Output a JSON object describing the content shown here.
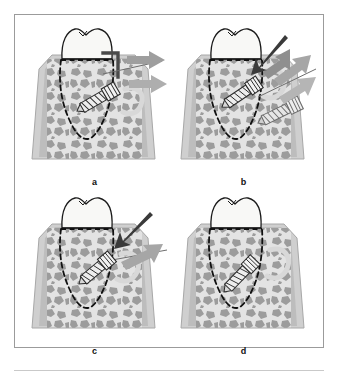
{
  "figure": {
    "kind": "dental-surgical-illustration",
    "frame_border_color": "#9b9b9b",
    "background_color": "#ffffff",
    "panel_count": 4
  },
  "palette": {
    "enamel_fill": "#f7f7f5",
    "enamel_outline": "#1a1a1a",
    "cortical_bone": "#b8b8b8",
    "cortical_bone_edge": "#d7d7d7",
    "trabecular_bg": "#e2e2e2",
    "trabecular_fill": "#9a9a9a",
    "root_outline_dashed": "#111111",
    "arrow_gray": "#9e9e9e",
    "arrow_gray_light": "#b5b5b5",
    "arrow_dark": "#3a3a3a",
    "screw_outline": "#2a2a2a",
    "screw_fill": "#ededed",
    "instrument_dark": "#4a4a4a",
    "halo_gray": "#d5d5d5",
    "label_color": "#111111"
  },
  "panels": [
    {
      "id": "a",
      "label": "a",
      "caption_letter": "a",
      "stage": "screw engaged with driver, insertion force applied",
      "has_tooth": true,
      "has_dashed_root_outline": true,
      "has_screw_in_bone": true,
      "has_second_screw": false,
      "has_dark_arrow": false,
      "has_l_shaped_instrument": true,
      "gray_arrow_count": 2,
      "arrow_direction": "left"
    },
    {
      "id": "b",
      "label": "b",
      "caption_letter": "b",
      "stage": "screw driven deeper, spare screw shown alongside",
      "has_tooth": true,
      "has_dashed_root_outline": true,
      "has_screw_in_bone": true,
      "has_second_screw": true,
      "has_dark_arrow": true,
      "has_l_shaped_instrument": false,
      "gray_arrow_count": 3,
      "arrow_direction": "down-left"
    },
    {
      "id": "c",
      "label": "c",
      "caption_letter": "c",
      "stage": "screw seated at shallower angle with guide line",
      "has_tooth": true,
      "has_dashed_root_outline": true,
      "has_screw_in_bone": true,
      "has_second_screw": false,
      "has_dark_arrow": true,
      "has_l_shaped_instrument": false,
      "gray_arrow_count": 1,
      "arrow_direction": "down-left"
    },
    {
      "id": "d",
      "label": "d",
      "caption_letter": "d",
      "stage": "final placement, no instrumentation",
      "has_tooth": true,
      "has_dashed_root_outline": true,
      "has_screw_in_bone": true,
      "has_second_screw": false,
      "has_dark_arrow": false,
      "has_l_shaped_instrument": false,
      "gray_arrow_count": 0,
      "arrow_direction": "none"
    }
  ]
}
